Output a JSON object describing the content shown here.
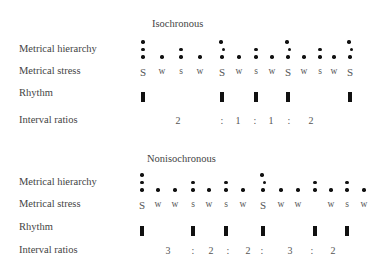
{
  "panels": [
    {
      "title": "Isochronous",
      "row_labels": {
        "hierarchy": "Metrical hierarchy",
        "stress": "Metrical stress",
        "rhythm": "Rhythm",
        "intervals": "Interval ratios"
      },
      "columns": [
        {
          "x": 143,
          "dots": 3,
          "stress": "S",
          "beat": true
        },
        {
          "x": 162,
          "dots": 1,
          "stress": "w",
          "beat": false
        },
        {
          "x": 181,
          "dots": 2,
          "stress": "s",
          "beat": false
        },
        {
          "x": 200,
          "dots": 1,
          "stress": "w",
          "beat": false
        },
        {
          "x": 222,
          "dots": 3,
          "stress": "S",
          "beat": true
        },
        {
          "x": 239,
          "dots": 1,
          "stress": "w",
          "beat": false
        },
        {
          "x": 256,
          "dots": 2,
          "stress": "s",
          "beat": true
        },
        {
          "x": 272,
          "dots": 1,
          "stress": "w",
          "beat": false
        },
        {
          "x": 288,
          "dots": 3,
          "stress": "S",
          "beat": true
        },
        {
          "x": 304,
          "dots": 1,
          "stress": "w",
          "beat": false
        },
        {
          "x": 320,
          "dots": 2,
          "stress": "s",
          "beat": false
        },
        {
          "x": 334,
          "dots": 1,
          "stress": "w",
          "beat": false
        },
        {
          "x": 350,
          "dots": 3,
          "stress": "S",
          "beat": true
        }
      ],
      "ratios": [
        {
          "x": 178,
          "text": "2"
        },
        {
          "x": 222,
          "text": ":"
        },
        {
          "x": 238,
          "text": "1"
        },
        {
          "x": 255,
          "text": ":"
        },
        {
          "x": 271,
          "text": "1"
        },
        {
          "x": 289,
          "text": ":"
        },
        {
          "x": 311,
          "text": "2"
        }
      ]
    },
    {
      "title": "Nonisochronous",
      "row_labels": {
        "hierarchy": "Metrical hierarchy",
        "stress": "Metrical stress",
        "rhythm": "Rhythm",
        "intervals": "Interval ratios"
      },
      "columns": [
        {
          "x": 142,
          "dots": 3,
          "stress": "S",
          "beat": true
        },
        {
          "x": 158,
          "dots": 1,
          "stress": "w",
          "beat": false
        },
        {
          "x": 175,
          "dots": 1,
          "stress": "w",
          "beat": false
        },
        {
          "x": 193,
          "dots": 2,
          "stress": "s",
          "beat": true
        },
        {
          "x": 209,
          "dots": 1,
          "stress": "w",
          "beat": false
        },
        {
          "x": 226,
          "dots": 2,
          "stress": "s",
          "beat": true
        },
        {
          "x": 243,
          "dots": 1,
          "stress": "w",
          "beat": false
        },
        {
          "x": 263,
          "dots": 3,
          "stress": "S",
          "beat": true
        },
        {
          "x": 281,
          "dots": 1,
          "stress": "w",
          "beat": false
        },
        {
          "x": 298,
          "dots": 1,
          "stress": "w",
          "beat": false
        },
        {
          "x": 315,
          "dots": 2,
          "stress": "",
          "beat": true
        },
        {
          "x": 331,
          "dots": 1,
          "stress": "w",
          "beat": false
        },
        {
          "x": 347,
          "dots": 2,
          "stress": "s",
          "beat": true
        },
        {
          "x": 364,
          "dots": 1,
          "stress": "w",
          "beat": false
        }
      ],
      "ratios": [
        {
          "x": 168,
          "text": "3"
        },
        {
          "x": 193,
          "text": ":"
        },
        {
          "x": 211,
          "text": "2"
        },
        {
          "x": 228,
          "text": ":"
        },
        {
          "x": 248,
          "text": "2"
        },
        {
          "x": 262,
          "text": ":"
        },
        {
          "x": 290,
          "text": "3"
        },
        {
          "x": 312,
          "text": ":"
        },
        {
          "x": 333,
          "text": "2"
        }
      ]
    }
  ]
}
